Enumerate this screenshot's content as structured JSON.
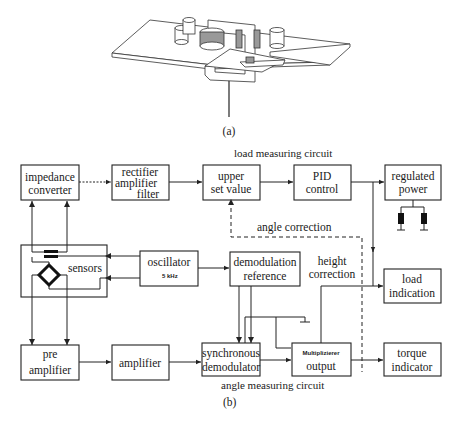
{
  "figure_a": {
    "caption": "(a)",
    "description": "Isometric drawing of a sensor plate with cylindrical components, a coil, a C-shaped magnetic yoke and a vertical pin"
  },
  "figure_b": {
    "caption": "(b)",
    "section_labels": {
      "load": "load measuring circuit",
      "angle": "angle measuring circuit"
    },
    "boxes": {
      "impedance_converter": [
        "impedance",
        "converter"
      ],
      "rectifier": [
        "rectifier",
        "amplifier",
        "filter"
      ],
      "upper_set_value": [
        "upper",
        "set value"
      ],
      "pid_control": [
        "PID",
        "control"
      ],
      "regulated_power": [
        "regulated",
        "power"
      ],
      "sensors": "sensors",
      "oscillator": "oscillator",
      "oscillator_freq": "5 kHz",
      "demodulation_reference": [
        "demodulation",
        "reference"
      ],
      "load_indication": [
        "load",
        "indication"
      ],
      "pre_amplifier": [
        "pre",
        "amplifier"
      ],
      "amplifier": "amplifier",
      "synchronous_demodulator": [
        "synchronous",
        "demodulator"
      ],
      "multiplier_output": [
        "Multiplizierer",
        "output"
      ],
      "torque_indicator": [
        "torque",
        "indicator"
      ]
    },
    "annotations": {
      "angle_correction": "angle correction",
      "height_correction": [
        "height",
        "correction"
      ]
    }
  }
}
